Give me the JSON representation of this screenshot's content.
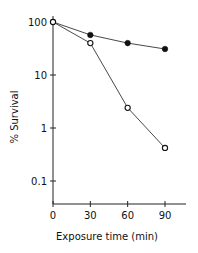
{
  "chart_data": {
    "type": "line",
    "title": "",
    "xlabel": "Exposure time (min)",
    "ylabel": "% Survival",
    "yscale": "log",
    "ylim": [
      0.05,
      120
    ],
    "xlim": [
      0,
      105
    ],
    "x_ticks": [
      0,
      30,
      60,
      90
    ],
    "x_tick_labels": [
      "0",
      "30",
      "60",
      "90"
    ],
    "y_ticks": [
      100,
      10,
      1,
      0.1
    ],
    "y_tick_labels": [
      "100",
      "10",
      "1",
      "0.1"
    ],
    "grid": false,
    "legend": "none",
    "series": [
      {
        "name": "filled circles",
        "marker": "filled-circle",
        "x": [
          0,
          30,
          60,
          90
        ],
        "values": [
          100,
          57,
          40,
          31
        ]
      },
      {
        "name": "open circles",
        "marker": "open-circle",
        "x": [
          0,
          30,
          60,
          90
        ],
        "values": [
          100,
          40,
          2.4,
          0.42
        ]
      }
    ]
  }
}
